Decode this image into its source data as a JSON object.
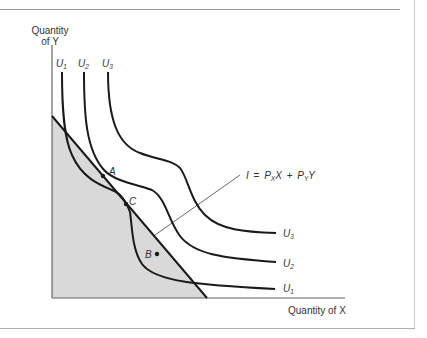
{
  "diagram": {
    "y_axis_label_line1": "Quantity",
    "y_axis_label_line2": "of Y",
    "x_axis_label": "Quantity of X",
    "budget_line_label": {
      "I": "I",
      "eq": "=",
      "P": "P",
      "x_sub": "X",
      "X": "X",
      "plus": "+",
      "P2": "P",
      "y_sub": "Y",
      "Y": "Y"
    },
    "curves": [
      {
        "name": "U",
        "sub": "1"
      },
      {
        "name": "U",
        "sub": "2"
      },
      {
        "name": "U",
        "sub": "3"
      }
    ],
    "points": [
      {
        "label": "A"
      },
      {
        "label": "B"
      },
      {
        "label": "C"
      }
    ],
    "colors": {
      "curve": "#1a1a1a",
      "axis": "#555555",
      "shade": "#d9d9d9",
      "leader": "#666666"
    }
  }
}
